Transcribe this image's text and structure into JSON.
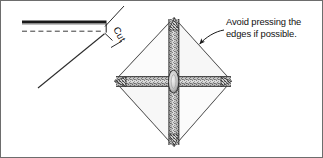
{
  "figure": {
    "background_color": "#ffffff",
    "ink_color": "#1a1a1a",
    "border_color": "#5a5a5a",
    "width": 323,
    "height": 158
  },
  "labels": {
    "cut": "Cut",
    "avoid_line1": "Avoid pressing the",
    "avoid_line2": "edges if possible."
  },
  "left_diagram": {
    "name": "cut-detail",
    "solid_edge_label": "solid cut edge",
    "dashed_edge_label": "dashed fold line",
    "solid_edge": {
      "x1": 22,
      "y1": 22,
      "x2": 106,
      "y2": 22
    },
    "dashed_edge": {
      "x1": 22,
      "y1": 31,
      "x2": 104,
      "y2": 31
    },
    "corner": {
      "x": 106,
      "y": 33
    },
    "diagonal": {
      "x1": 104,
      "y1": 34,
      "x2": 38,
      "y2": 88
    },
    "leader": {
      "x1": 122,
      "y1": 8,
      "x2": 104,
      "y2": 27
    },
    "tick": {
      "x1": 112,
      "y1": 46,
      "x2": 122,
      "y2": 40
    }
  },
  "right_diagram": {
    "name": "folded-diamond",
    "description": "square folded on both diagonals forming a diamond with crossed pressed bands",
    "center": {
      "x": 173,
      "y": 82
    },
    "vertices": {
      "top": {
        "x": 174,
        "y": 18
      },
      "right": {
        "x": 231,
        "y": 81
      },
      "bottom": {
        "x": 174,
        "y": 146
      },
      "left": {
        "x": 115,
        "y": 81
      }
    },
    "band_half_width": 6,
    "hub_rx": 5,
    "hub_ry": 11,
    "arrow": {
      "tip_x": 198,
      "tip_y": 45,
      "tail_x": 222,
      "tail_y": 31
    }
  },
  "text_positions": {
    "cut": {
      "x": 117,
      "y": 24,
      "rotation": 62
    },
    "avoid_line1": {
      "x": 226,
      "y": 25
    },
    "avoid_line2": {
      "x": 226,
      "y": 37
    }
  }
}
